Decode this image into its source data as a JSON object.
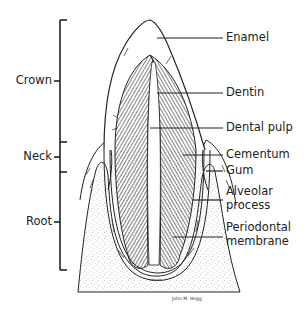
{
  "diagram": {
    "regions": [
      {
        "label": "Crown"
      },
      {
        "label": "Neck"
      },
      {
        "label": "Root"
      }
    ],
    "parts": [
      {
        "label": "Enamel"
      },
      {
        "label": "Dentin"
      },
      {
        "label": "Dental pulp"
      },
      {
        "label": "Cementum"
      },
      {
        "label": "Gum"
      },
      {
        "label": "Alveolar",
        "label2": "process"
      },
      {
        "label": "Periodontal",
        "label2": "membrane"
      }
    ],
    "signature": "John M. Hogg"
  }
}
